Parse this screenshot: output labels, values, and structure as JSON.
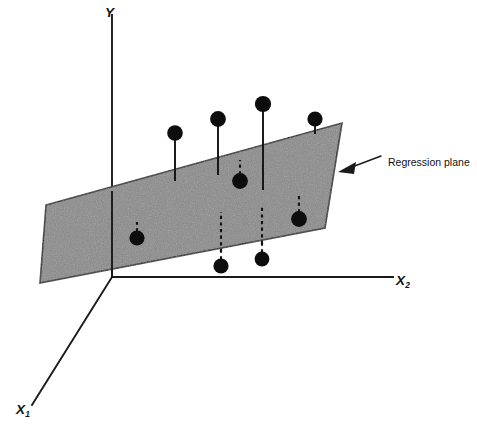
{
  "figure": {
    "background_color": "#ffffff",
    "width": 477,
    "height": 434
  },
  "axes": {
    "y": {
      "label": "Y",
      "name": "y-axis",
      "orientation": "vertical"
    },
    "x2": {
      "label": "X",
      "subscript": "2",
      "name": "x2-axis",
      "orientation": "horizontal-right"
    },
    "x1": {
      "label": "X",
      "subscript": "1",
      "name": "x1-axis",
      "orientation": "diagonal-lower-left"
    }
  },
  "annotations": {
    "regression_plane": {
      "text": "Regression plane",
      "arrow": "left-pointing",
      "target": "regression-plane"
    }
  },
  "colors": {
    "plane_fill": "#8a8a8a",
    "plane_stroke": "#1a1a1a",
    "dot_fill": "#0d0d0d",
    "axis_stroke": "#1a1a1a",
    "text": "#111111",
    "background": "#ffffff"
  },
  "chart_data": {
    "type": "scatter",
    "title": "Regression plane",
    "xlabel": "X1",
    "ylabel": "Y",
    "zlabel": "X2",
    "grid": false,
    "legend": "none",
    "projection": "3d-oblique",
    "plane": {
      "label": "Regression plane",
      "fill": "#8a8a8a",
      "vertices": [
        {
          "x": 46,
          "y": 205
        },
        {
          "x": 342,
          "y": 123
        },
        {
          "x": 325,
          "y": 228
        },
        {
          "x": 40,
          "y": 283
        }
      ]
    },
    "axis_geometry": {
      "origin": {
        "x": 112,
        "y": 277
      },
      "y_axis_top": {
        "x": 112,
        "y": 15
      },
      "x2_axis_end": {
        "x": 393,
        "y": 277
      },
      "x1_axis_end": {
        "x": 32,
        "y": 405
      }
    },
    "points": [
      {
        "id": "p1",
        "x": 175,
        "y": 133,
        "stem_to_y": 181,
        "residual": "positive",
        "stem": "solid"
      },
      {
        "id": "p2",
        "x": 218,
        "y": 119,
        "stem_to_y": 175,
        "residual": "positive",
        "stem": "solid"
      },
      {
        "id": "p3",
        "x": 263,
        "y": 104,
        "stem_to_y": 190,
        "residual": "positive",
        "stem": "solid"
      },
      {
        "id": "p4",
        "x": 315,
        "y": 119,
        "stem_to_y": 134,
        "residual": "positive",
        "stem": "solid"
      },
      {
        "id": "p5",
        "x": 240,
        "y": 181,
        "stem_to_y": 160,
        "residual": "negative",
        "stem": "dashed"
      },
      {
        "id": "p6",
        "x": 299,
        "y": 219,
        "stem_to_y": 196,
        "residual": "negative",
        "stem": "dashed"
      },
      {
        "id": "p7",
        "x": 137,
        "y": 238,
        "stem_to_y": 222,
        "residual": "negative",
        "stem": "dashed"
      },
      {
        "id": "p8",
        "x": 221,
        "y": 266,
        "stem_to_y": 214,
        "residual": "negative",
        "stem": "dashed"
      },
      {
        "id": "p9",
        "x": 262,
        "y": 259,
        "stem_to_y": 208,
        "residual": "negative",
        "stem": "dashed"
      }
    ],
    "point_count": 9,
    "above_plane_count": 4,
    "below_plane_count": 5
  }
}
